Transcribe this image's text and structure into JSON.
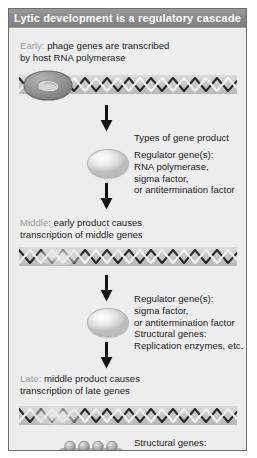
{
  "figure": {
    "title": "Lytic development is a regulatory cascade",
    "panel_bg": "#ededed",
    "title_bar_color": "#8c8c8c",
    "title_text_color": "#ffffff",
    "border_color": "#6e6e6e",
    "stage_label_color": "#9b9b9b",
    "body_text_color": "#232323",
    "dna_bar_color": "#c9c9c9",
    "arrow_color": "#121212",
    "oval_color": "#e2e2e2",
    "polymerase_color": "#8f8f8f"
  },
  "stages": {
    "early": {
      "label": "Early:",
      "text_line1": " phage genes are transcribed",
      "text_line2": "by host RNA polymerase"
    },
    "middle": {
      "label": "Middle:",
      "text_line1": " early product causes",
      "text_line2": "transcription of middle genes"
    },
    "late": {
      "label": "Late:",
      "text_line1": " middle product causes",
      "text_line2": "transcription of late genes"
    }
  },
  "annotations": {
    "types_heading": "Types of gene product",
    "block1": [
      "Regulator gene(s):",
      "RNA polymerase,",
      "sigma factor,",
      "or antitermination factor"
    ],
    "block2": [
      "Regulator gene(s):",
      "sigma factor,",
      "or antitermination factor",
      "Structural genes:",
      "Replication enzymes, etc."
    ],
    "block3": [
      "Structural genes:",
      "Phage components"
    ]
  },
  "graphics": {
    "dna_early": "dna-helix-with-polymerase",
    "dna_middle": "dna-helix-transcription-bubble",
    "dna_late": "dna-helix-transcription-bubble",
    "gene_product_oval": "gene-product-oval",
    "phage_chain": "phage-component-chain",
    "arrow": "down-arrow"
  }
}
